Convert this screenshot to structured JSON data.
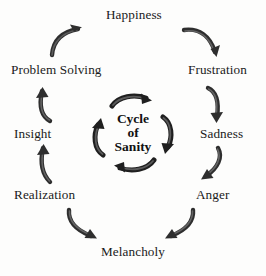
{
  "diagram": {
    "title": "Cycle of Sanity",
    "type": "circular-cycle",
    "direction": "clockwise",
    "background_color": "#fdfdfc",
    "text_color": "#1a1a1a",
    "arrow_color": "#2b2b2b",
    "hub": {
      "line1": "Cycle",
      "line2": "of",
      "line3": "Sanity"
    },
    "stages": [
      {
        "label": "Happiness",
        "position": "top"
      },
      {
        "label": "Frustration",
        "position": "upper-right"
      },
      {
        "label": "Sadness",
        "position": "right"
      },
      {
        "label": "Anger",
        "position": "lower-right"
      },
      {
        "label": "Melancholy",
        "position": "bottom"
      },
      {
        "label": "Realization",
        "position": "lower-left"
      },
      {
        "label": "Insight",
        "position": "left"
      },
      {
        "label": "Problem Solving",
        "position": "upper-left"
      }
    ],
    "connectors": [
      {
        "name": "problem-solving-to-happiness",
        "from": "Problem Solving",
        "to": "Happiness"
      },
      {
        "name": "happiness-to-frustration",
        "from": "Happiness",
        "to": "Frustration"
      },
      {
        "name": "frustration-to-sadness",
        "from": "Frustration",
        "to": "Sadness"
      },
      {
        "name": "sadness-to-anger",
        "from": "Sadness",
        "to": "Anger"
      },
      {
        "name": "anger-to-melancholy",
        "from": "Anger",
        "to": "Melancholy"
      },
      {
        "name": "melancholy-to-realization",
        "from": "Melancholy",
        "to": "Realization"
      },
      {
        "name": "realization-to-insight",
        "from": "Realization",
        "to": "Insight"
      },
      {
        "name": "insight-to-problem-solving",
        "from": "Insight",
        "to": "Problem Solving"
      }
    ],
    "hub_arrows": [
      {
        "name": "hub-arrow-top"
      },
      {
        "name": "hub-arrow-right"
      },
      {
        "name": "hub-arrow-bottom"
      },
      {
        "name": "hub-arrow-left"
      }
    ]
  }
}
